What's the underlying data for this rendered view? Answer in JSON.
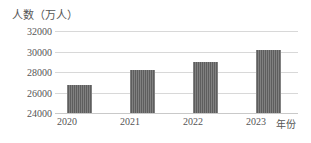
{
  "chart_data": {
    "type": "bar",
    "title": "",
    "xlabel": "年份",
    "ylabel": "人数（万人）",
    "categories": [
      "2020",
      "2021",
      "2022",
      "2023"
    ],
    "values": [
      26700,
      28200,
      29000,
      30100
    ],
    "series": [
      {
        "name": "人数",
        "values": [
          26700,
          28200,
          29000,
          30100
        ]
      }
    ],
    "ylim": [
      24000,
      32000
    ],
    "ytick_labels": [
      "24000",
      "26000",
      "28000",
      "30000",
      "32000"
    ],
    "ytick_values": [
      24000,
      26000,
      28000,
      30000,
      32000
    ],
    "ystep": 2000,
    "grid": true,
    "legend": false,
    "bar_color": "#5e5e5e",
    "grid_color": "#d8d8d8"
  },
  "caption": {
    "text": ""
  }
}
